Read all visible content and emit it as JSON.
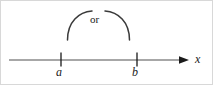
{
  "figure": {
    "kind": "number-line-diagram",
    "background_color": "#ffffff",
    "border_color": "#d8d8d8",
    "stroke_color": "#3a3a3a",
    "text_color": "#1a1a1a",
    "axis": {
      "name": "x-axis",
      "label": "x",
      "line_color": "#8a8a8a",
      "arrow_color": "#1a1a1a",
      "start_x": 8,
      "end_x": 186,
      "y": 59
    },
    "ticks": [
      {
        "label": "a",
        "x": 60
      },
      {
        "label": "b",
        "x": 136
      }
    ],
    "connector": {
      "name": "or-bracket",
      "label": "or",
      "left_arc_x": 66,
      "right_arc_x": 128,
      "top_y": 10,
      "bottom_y": 39
    }
  }
}
